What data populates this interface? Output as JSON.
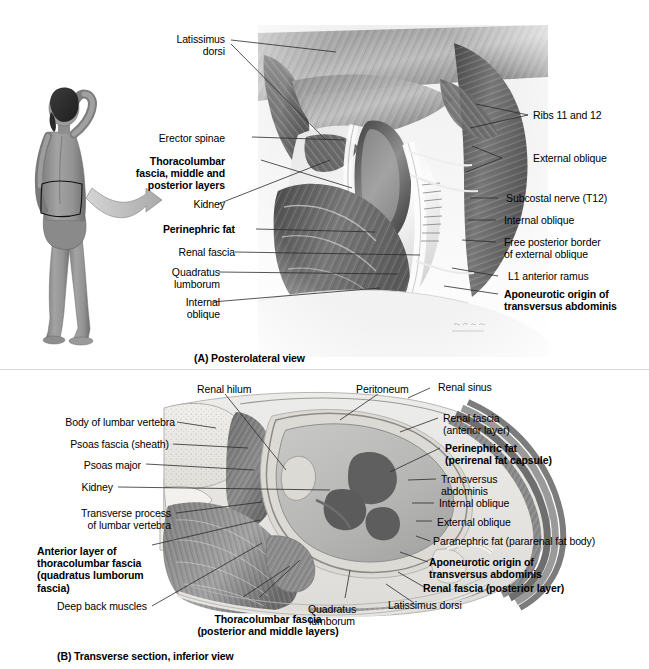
{
  "figure": {
    "panels": [
      {
        "id": "A",
        "caption": "(A) Posterolateral view"
      },
      {
        "id": "B",
        "caption": "(B) Transverse section, inferior view"
      }
    ],
    "artist_signature": "netterbili"
  },
  "panel_a": {
    "caption": "(A) Posterolateral view",
    "labels_left": [
      {
        "id": "latissimus-dorsi",
        "text": "Latissimus\ndorsi",
        "bold": false
      },
      {
        "id": "erector-spinae",
        "text": "Erector spinae",
        "bold": false
      },
      {
        "id": "thoracolumbar-fascia",
        "text": "Thoracolumbar\nfascia, middle and\nposterior layers",
        "bold": true
      },
      {
        "id": "kidney",
        "text": "Kidney",
        "bold": false
      },
      {
        "id": "perinephric-fat",
        "text": "Perinephric fat",
        "bold": true
      },
      {
        "id": "renal-fascia",
        "text": "Renal fascia",
        "bold": false
      },
      {
        "id": "quadratus-lumborum",
        "text": "Quadratus\nlumborum",
        "bold": false
      },
      {
        "id": "internal-oblique",
        "text": "Internal\noblique",
        "bold": false
      }
    ],
    "labels_right": [
      {
        "id": "ribs-11-and-12",
        "text": "Ribs 11 and 12",
        "bold": false
      },
      {
        "id": "external-oblique",
        "text": "External oblique",
        "bold": false
      },
      {
        "id": "subcostal-nerve",
        "text": "Subcostal nerve (T12)",
        "bold": false
      },
      {
        "id": "internal-oblique",
        "text": "Internal oblique",
        "bold": false
      },
      {
        "id": "free-posterior-border",
        "text": "Free posterior border\nof external oblique",
        "bold": false
      },
      {
        "id": "l1-anterior-ramus",
        "text": "L1 anterior ramus",
        "bold": false
      },
      {
        "id": "aponeurotic-origin",
        "text": "Aponeurotic origin of\ntransversus abdominis",
        "bold": true
      }
    ]
  },
  "panel_b": {
    "caption": "(B) Transverse section, inferior view",
    "labels_top": [
      {
        "id": "renal-hilum",
        "text": "Renal hilum",
        "bold": false
      },
      {
        "id": "peritoneum",
        "text": "Peritoneum",
        "bold": false
      },
      {
        "id": "renal-sinus",
        "text": "Renal sinus",
        "bold": false
      }
    ],
    "labels_left": [
      {
        "id": "body-of-lumbar-vertebra",
        "text": "Body of lumbar vertebra",
        "bold": false
      },
      {
        "id": "psoas-fascia",
        "text": "Psoas fascia (sheath)",
        "bold": false
      },
      {
        "id": "psoas-major",
        "text": "Psoas major",
        "bold": false
      },
      {
        "id": "kidney",
        "text": "Kidney",
        "bold": false
      },
      {
        "id": "transverse-process",
        "text": "Transverse process\nof lumbar vertebra",
        "bold": false
      },
      {
        "id": "anterior-layer-thoracolumbar-fascia",
        "text": "Anterior layer of\nthoracolumbar fascia\n(quadratus lumborum\nfascia)",
        "bold": true
      },
      {
        "id": "deep-back-muscles",
        "text": "Deep back muscles",
        "bold": false
      }
    ],
    "labels_right": [
      {
        "id": "renal-fascia-anterior-layer",
        "text": "Renal fascia\n(anterior layer)",
        "bold": false
      },
      {
        "id": "perinephric-fat",
        "text": "Perinephric fat\n (perirenal fat capsule)",
        "bold": true
      },
      {
        "id": "transversus-abdominis",
        "text": "Transversus\n abdominis",
        "bold": false
      },
      {
        "id": "internal-oblique",
        "text": "Internal oblique",
        "bold": false
      },
      {
        "id": "external-oblique",
        "text": "External oblique",
        "bold": false
      },
      {
        "id": "paranephric-fat",
        "text": "Paranephric fat (pararenal fat body)",
        "bold": false
      },
      {
        "id": "aponeurotic-origin",
        "text": "Aponeurotic origin of\ntransversus abdominis",
        "bold": true
      },
      {
        "id": "renal-fascia-posterior-layer",
        "text": "Renal fascia (posterior layer)",
        "bold": true
      },
      {
        "id": "latissimus-dorsi",
        "text": "Latissimus dorsi",
        "bold": false
      }
    ],
    "labels_bottom": [
      {
        "id": "thoracolumbar-fascia-posterior-middle",
        "text": "Thoracolumbar fascia\n(posterior and middle layers)",
        "bold": true
      },
      {
        "id": "quadratus-lumborum",
        "text": "Quadratus\nlumborum",
        "bold": false
      }
    ]
  },
  "colors": {
    "text": "#000000",
    "leader": "#2b2b2b",
    "fat": "#d8d8d4",
    "muscle_dark": "#6e6e6e",
    "muscle_mid": "#8f8f8f",
    "bone": "#e8e8e4",
    "kidney": "#a8a8a8",
    "arrow": "#b9b9b9",
    "skin": "#9a9a9a"
  }
}
